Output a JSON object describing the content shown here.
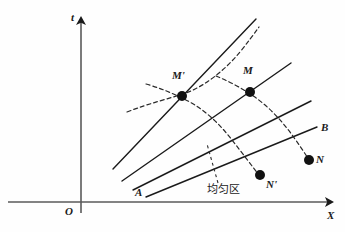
{
  "figure": {
    "type": "spacetime-diagram",
    "background_color": "#fefefe",
    "ink_color": "#1a1a1a"
  },
  "axes": {
    "vertical": {
      "label": "t",
      "label_x": 71,
      "label_y": 12,
      "x": 81,
      "y_top": 14,
      "y_bottom": 213
    },
    "horizontal": {
      "label": "X",
      "label_x": 327,
      "label_y": 210,
      "y": 202,
      "x_left": 8,
      "x_right": 336
    },
    "origin": {
      "label": "O",
      "label_x": 65,
      "label_y": 206
    }
  },
  "solid_lines": [
    {
      "name": "characteristic-1",
      "x1": 113,
      "y1": 169,
      "x2": 256,
      "y2": 19
    },
    {
      "name": "characteristic-2",
      "x1": 122,
      "y1": 181,
      "x2": 291,
      "y2": 63
    },
    {
      "name": "characteristic-3",
      "x1": 133,
      "y1": 190,
      "x2": 311,
      "y2": 101
    },
    {
      "name": "characteristic-4-AB",
      "x1": 146,
      "y1": 197,
      "x2": 317,
      "y2": 127
    }
  ],
  "dashed_curves": [
    {
      "name": "dashed-curve-1",
      "path": "M 127,112 C 150,103 168,99 186,93 C 205,86 225,70 240,52 C 248,42 254,34 259,27"
    },
    {
      "name": "dashed-curve-2",
      "path": "M 146,84 C 160,88 172,93 184,99 C 203,108 219,123 232,140 C 243,154 252,166 259,175"
    },
    {
      "name": "dashed-curve-3",
      "path": "M 216,76 C 228,81 240,87 250,94 C 268,105 283,122 295,139 C 302,149 306,155 309,160"
    }
  ],
  "dashed_leader": {
    "name": "label-leader-line",
    "x1": 218,
    "y1": 183,
    "x2": 207,
    "y2": 144
  },
  "points": [
    {
      "name": "point-M-prime",
      "label": "M'",
      "cx": 182,
      "cy": 96,
      "r": 5,
      "label_x": 172,
      "label_y": 70
    },
    {
      "name": "point-M",
      "label": "M",
      "cx": 250,
      "cy": 92,
      "r": 5,
      "label_x": 243,
      "label_y": 65
    },
    {
      "name": "point-N-prime",
      "label": "N'",
      "cx": 260,
      "cy": 175,
      "r": 5,
      "label_x": 266,
      "label_y": 179
    },
    {
      "name": "point-N",
      "label": "N",
      "cx": 309,
      "cy": 160,
      "r": 5,
      "label_x": 316,
      "label_y": 154
    }
  ],
  "line_labels": [
    {
      "name": "label-A",
      "text": "A",
      "x": 135,
      "y": 187
    },
    {
      "name": "label-B",
      "text": "B",
      "x": 321,
      "y": 122
    }
  ],
  "region_label": {
    "name": "uniform-region-label",
    "text": "均匀区",
    "x": 207,
    "y": 184
  }
}
